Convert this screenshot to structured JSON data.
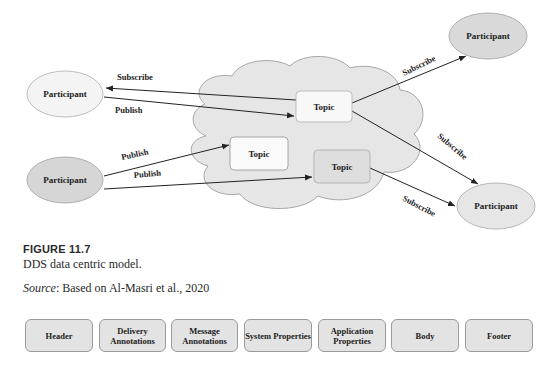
{
  "diagram": {
    "participants": [
      {
        "label": "Participant",
        "position": "top-left",
        "fill": "#f4f4f4"
      },
      {
        "label": "Participant",
        "position": "bottom-left",
        "fill": "#d6d6d6"
      },
      {
        "label": "Participant",
        "position": "top-right",
        "fill": "#d9d9d9"
      },
      {
        "label": "Participant",
        "position": "bottom-right",
        "fill": "#e6e6e6"
      }
    ],
    "topics": [
      {
        "label": "Topic",
        "fill": "#f8f8f8"
      },
      {
        "label": "Topic",
        "fill": "#fafafa"
      },
      {
        "label": "Topic",
        "fill": "#dedede"
      }
    ],
    "edges": [
      {
        "label": "Subscribe",
        "from": "Topic 1",
        "to": "Participant top-left"
      },
      {
        "label": "Publish",
        "from": "Participant top-left",
        "to": "Topic 1"
      },
      {
        "label": "Publish",
        "from": "Participant bottom-left",
        "to": "Topic 2"
      },
      {
        "label": "Publish",
        "from": "Participant bottom-left",
        "to": "Topic 3"
      },
      {
        "label": "Subscribe",
        "from": "Topic 1",
        "to": "Participant top-right"
      },
      {
        "label": "Subscribe",
        "from": "Topic 1",
        "to": "Participant bottom-right"
      },
      {
        "label": "Subscribe",
        "from": "Topic 3",
        "to": "Participant bottom-right"
      }
    ],
    "cloud_fill": "#e8e8e8"
  },
  "caption": {
    "figure_number": "FIGURE 11.7",
    "title": "DDS data centric model.",
    "source_label": "Source",
    "source_text": ": Based on Al-Masri et al., 2020"
  },
  "message_format": {
    "segments": [
      {
        "label": "Header"
      },
      {
        "label": "Delivery Annotations"
      },
      {
        "label": "Message Annotations"
      },
      {
        "label": "System Properties"
      },
      {
        "label": "Application Properties"
      },
      {
        "label": "Body"
      },
      {
        "label": "Footer"
      }
    ]
  }
}
